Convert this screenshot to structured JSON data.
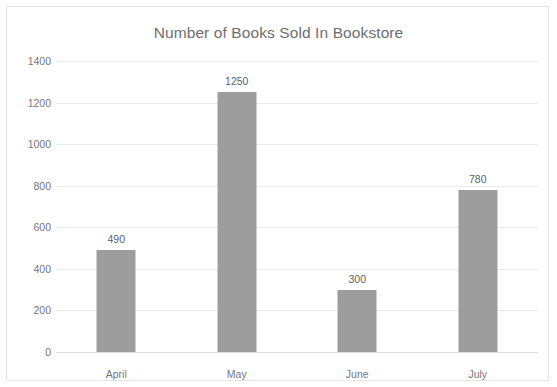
{
  "chart_data": {
    "type": "bar",
    "title": "Number of Books Sold In Bookstore",
    "xlabel": "",
    "ylabel": "",
    "categories": [
      "April",
      "May",
      "June",
      "July"
    ],
    "values": [
      490,
      1250,
      300,
      780
    ],
    "data_labels": [
      "490",
      "1250",
      "300",
      "780"
    ],
    "ylim": [
      0,
      1400
    ],
    "yticks": [
      0,
      200,
      400,
      600,
      800,
      1000,
      1200,
      1400
    ],
    "ytick_labels": [
      "0",
      "200",
      "400",
      "600",
      "800",
      "1000",
      "1200",
      "1400"
    ],
    "grid": "horizontal",
    "legend": "none",
    "series": [
      {
        "name": "Books Sold",
        "values": [
          490,
          1250,
          300,
          780
        ],
        "color": "#9d9d9d"
      }
    ],
    "colors": {
      "bar": "#9d9d9d",
      "gridline": "#e9e9e9",
      "baseline": "#dcdcdc",
      "border": "#e4e4e4",
      "title_text": "#6e6e6e",
      "tick_text": "#767676",
      "value_text": "#5f5f5f",
      "background": "#ffffff"
    }
  }
}
